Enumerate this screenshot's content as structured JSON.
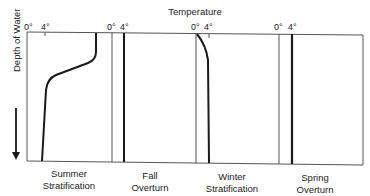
{
  "title": "Temperature",
  "y_axis_label": "Depth of Water",
  "panels": [
    {
      "name": "summer",
      "tick_0": "0°",
      "tick_4": "4°",
      "caption_line1": "Summer",
      "caption_line2": "Stratification"
    },
    {
      "name": "fall",
      "tick_0": "0°",
      "tick_4": "4°",
      "caption_line1": "Fall",
      "caption_line2": "Overturn"
    },
    {
      "name": "winter",
      "tick_0": "0°",
      "tick_4": "4°",
      "caption_line1": "Winter",
      "caption_line2": "Stratification"
    },
    {
      "name": "spring",
      "tick_0": "0°",
      "tick_4": "4°",
      "caption_line1": "Spring",
      "caption_line2": "Overturn"
    }
  ],
  "colors": {
    "line": "#1a1a1a",
    "frame": "#555555",
    "background": "#ffffff"
  }
}
